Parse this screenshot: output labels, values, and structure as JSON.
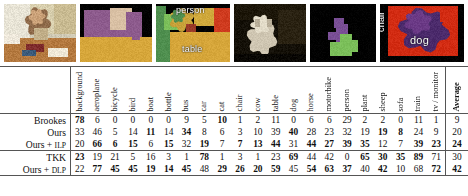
{
  "figure": {
    "images": [
      {
        "name": "input-photo-child",
        "label": null,
        "kind": "photo"
      },
      {
        "name": "segmentation-child-sofa",
        "label": null,
        "kind": "segmentation"
      },
      {
        "name": "segmentation-person-table",
        "label": "person",
        "label2": "table",
        "kind": "segmentation"
      },
      {
        "name": "input-photo-dog-dark",
        "label": null,
        "kind": "photo"
      },
      {
        "name": "segmentation-dog-sparse",
        "label": null,
        "kind": "segmentation"
      },
      {
        "name": "segmentation-chair-dog",
        "label": "dog",
        "label_vertical": "chair",
        "kind": "segmentation"
      }
    ],
    "overlay_labels": {
      "person": "person",
      "table": "table",
      "dog": "dog",
      "chair": "chair"
    }
  },
  "table": {
    "row_header": "",
    "columns": [
      "background",
      "aeroplane",
      "bicycle",
      "bird",
      "boat",
      "bottle",
      "bus",
      "car",
      "cat",
      "chair",
      "cow",
      "table",
      "dog",
      "horse",
      "motorbike",
      "person",
      "plant",
      "sheep",
      "sofa",
      "train",
      "tv / monitor"
    ],
    "average_column": "Average",
    "rows": [
      {
        "name": "Brookes",
        "name_small": "",
        "values": [
          78,
          6,
          0,
          0,
          0,
          0,
          9,
          5,
          10,
          1,
          2,
          11,
          0,
          6,
          6,
          29,
          2,
          2,
          0,
          11,
          1
        ],
        "bold": [
          true,
          false,
          false,
          false,
          false,
          false,
          false,
          false,
          true,
          false,
          false,
          false,
          false,
          false,
          false,
          false,
          false,
          false,
          false,
          false,
          false
        ],
        "average": 9,
        "average_bold": false
      },
      {
        "name": "Ours",
        "name_small": "",
        "values": [
          33,
          46,
          5,
          14,
          11,
          14,
          34,
          8,
          6,
          3,
          10,
          39,
          40,
          28,
          23,
          32,
          19,
          19,
          8,
          24,
          9
        ],
        "bold": [
          false,
          false,
          false,
          false,
          true,
          false,
          true,
          false,
          false,
          false,
          false,
          false,
          true,
          false,
          false,
          false,
          false,
          true,
          true,
          false,
          false
        ],
        "average": 20,
        "average_bold": false
      },
      {
        "name": "Ours + ",
        "name_small": "ILP",
        "values": [
          20,
          66,
          6,
          15,
          6,
          15,
          32,
          19,
          7,
          7,
          13,
          44,
          31,
          44,
          27,
          39,
          35,
          12,
          7,
          39,
          23
        ],
        "bold": [
          false,
          true,
          true,
          true,
          false,
          true,
          false,
          true,
          false,
          true,
          true,
          true,
          false,
          true,
          true,
          true,
          true,
          false,
          false,
          true,
          true
        ],
        "average": 24,
        "average_bold": true
      },
      {
        "name": "TKK",
        "name_small": "",
        "values": [
          23,
          19,
          21,
          5,
          16,
          3,
          1,
          78,
          1,
          3,
          1,
          23,
          69,
          44,
          42,
          0,
          65,
          30,
          35,
          89,
          71
        ],
        "bold": [
          true,
          false,
          false,
          false,
          false,
          false,
          false,
          true,
          false,
          false,
          false,
          false,
          true,
          false,
          false,
          false,
          true,
          true,
          true,
          true,
          false
        ],
        "average": 30,
        "average_bold": false
      },
      {
        "name": "Ours + ",
        "name_small": "DLP",
        "values": [
          22,
          77,
          45,
          45,
          19,
          14,
          45,
          48,
          29,
          26,
          20,
          59,
          45,
          54,
          63,
          37,
          40,
          42,
          10,
          68,
          72
        ],
        "bold": [
          false,
          true,
          true,
          true,
          true,
          true,
          true,
          false,
          true,
          true,
          true,
          true,
          false,
          true,
          true,
          true,
          false,
          true,
          false,
          false,
          true
        ],
        "average": 42,
        "average_bold": true
      }
    ],
    "separator_after_row_index": 2
  }
}
